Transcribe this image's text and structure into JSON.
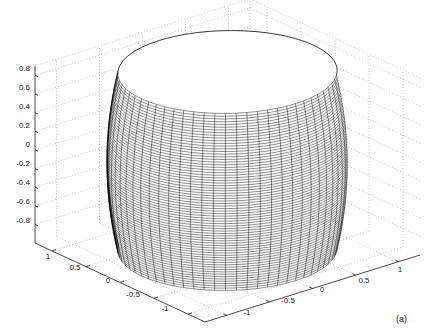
{
  "chart_data": {
    "type": "surface3d",
    "title": "",
    "panel_label": "(a)",
    "xlabel": "",
    "ylabel": "",
    "zlabel": "",
    "x_ticks": [
      "-1",
      "-0.5",
      "0",
      "0.5",
      "1"
    ],
    "y_ticks": [
      "1",
      "0.5",
      "0",
      "-0.5",
      "-1"
    ],
    "z_ticks": [
      "0.8",
      "0.6",
      "0.4",
      "0.2",
      "0",
      "-0.2",
      "-0.4",
      "-0.6",
      "-0.8"
    ],
    "xlim": [
      -1.25,
      1.25
    ],
    "ylim": [
      -1.25,
      1.25
    ],
    "zlim": [
      -1,
      0.9
    ],
    "grid": true,
    "grid_style": "dotted",
    "surface": {
      "shape": "cylinder",
      "radius_top": 1.0,
      "radius_mid": 1.1,
      "radius_bottom": 1.0,
      "z_range": [
        -1,
        0.9
      ],
      "mesh_color": "#000000",
      "face_color": "#ffffff",
      "n_circumferential": 64,
      "n_vertical": 70
    },
    "legend": null
  },
  "axes": {
    "z_tick_labels": [
      "0.8",
      "0.6",
      "0.4",
      "0.2",
      "0",
      "-0.2",
      "-0.4",
      "-0.6",
      "-0.8"
    ],
    "left_floor_tick_labels": [
      "1",
      "0.5",
      "0",
      "-0.5",
      "-1"
    ],
    "right_floor_tick_labels": [
      "-1",
      "-0.5",
      "0",
      "0.5",
      "1"
    ]
  },
  "colors": {
    "axis": "#333333",
    "grid": "#9a9a9a",
    "mesh": "#111111",
    "background": "#ffffff"
  }
}
